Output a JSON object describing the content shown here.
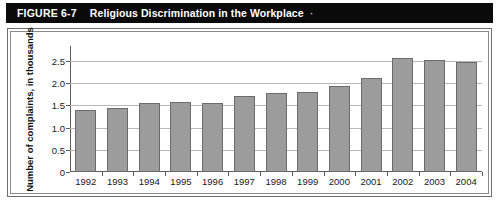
{
  "header": {
    "figure_number": "FIGURE 6-7",
    "title": "Religious Discrimination in the Workplace",
    "trailing_mark": "·"
  },
  "colors": {
    "header_background": "#0a0a0a",
    "header_text": "#ffffff",
    "bar_fill": "#9c9c9c",
    "bar_border": "#6b6b6b",
    "gridline": "#b9b9b9",
    "axis": "#5d5d5d",
    "frame_outer": "#6e6e6e",
    "frame_inner": "#8a8a8a",
    "plot_background": "#ffffff"
  },
  "chart_data": {
    "type": "bar",
    "title": "Religious Discrimination in the Workplace",
    "xlabel": "",
    "ylabel": "Number of complaints, in thousands",
    "categories": [
      "1992",
      "1993",
      "1994",
      "1995",
      "1996",
      "1997",
      "1998",
      "1999",
      "2000",
      "2001",
      "2002",
      "2003",
      "2004"
    ],
    "values": [
      1.39,
      1.45,
      1.55,
      1.58,
      1.56,
      1.72,
      1.79,
      1.81,
      1.94,
      2.13,
      2.57,
      2.53,
      2.47
    ],
    "ylim": [
      0,
      2.75
    ],
    "yticks": [
      0,
      0.5,
      1.0,
      1.5,
      2.0,
      2.5
    ],
    "ytick_labels": [
      "0",
      "0.5",
      "1.0",
      "1.5",
      "2.0",
      "2.5"
    ],
    "grid": true,
    "legend": null,
    "legend_position": "none"
  }
}
